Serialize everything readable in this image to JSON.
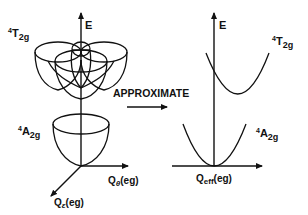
{
  "left_diagram": {
    "axis_energy_label": "E",
    "state_upper": {
      "sup": "4",
      "main": "T",
      "sub": "2g"
    },
    "state_lower": {
      "sup": "4",
      "main": "A",
      "sub": "2g"
    },
    "axis_theta": {
      "main": "Q",
      "sub": "θ",
      "suffix": "(eg)"
    },
    "axis_epsilon": {
      "main": "Q",
      "sub": "ε",
      "suffix": "(eg)"
    }
  },
  "transition": {
    "label": "APPROXIMATE"
  },
  "right_diagram": {
    "axis_energy_label": "E",
    "state_upper": {
      "sup": "4",
      "main": "T",
      "sub": "2g"
    },
    "state_lower": {
      "sup": "4",
      "main": "A",
      "sub": "2g"
    },
    "axis_eff": {
      "main": "Q",
      "sub": "eff",
      "suffix": "(eg)"
    }
  },
  "colors": {
    "ink": "#111111",
    "background": "#ffffff"
  }
}
